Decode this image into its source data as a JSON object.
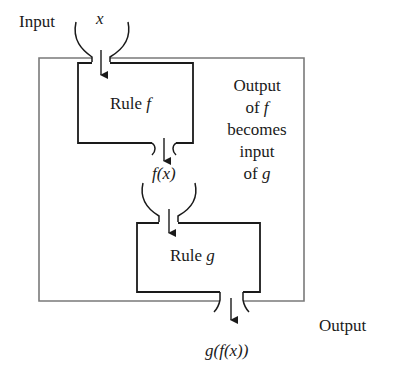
{
  "diagram": {
    "type": "function-composition",
    "labels": {
      "input": "Input",
      "output": "Output",
      "x": "x",
      "fx": "f(x)",
      "gfx": "g(f(x))"
    },
    "rule_f": {
      "prefix": "Rule ",
      "name": "f"
    },
    "rule_g": {
      "prefix": "Rule ",
      "name": "g"
    },
    "annotation": {
      "lines": [
        "Output",
        "of ",
        "becomes",
        "input",
        "of "
      ],
      "of_f_var": "f",
      "of_g_var": "g"
    },
    "colors": {
      "outer_frame": "#7a7a7a",
      "rule_boxes": "#222222",
      "text": "#1a1a1a"
    }
  }
}
